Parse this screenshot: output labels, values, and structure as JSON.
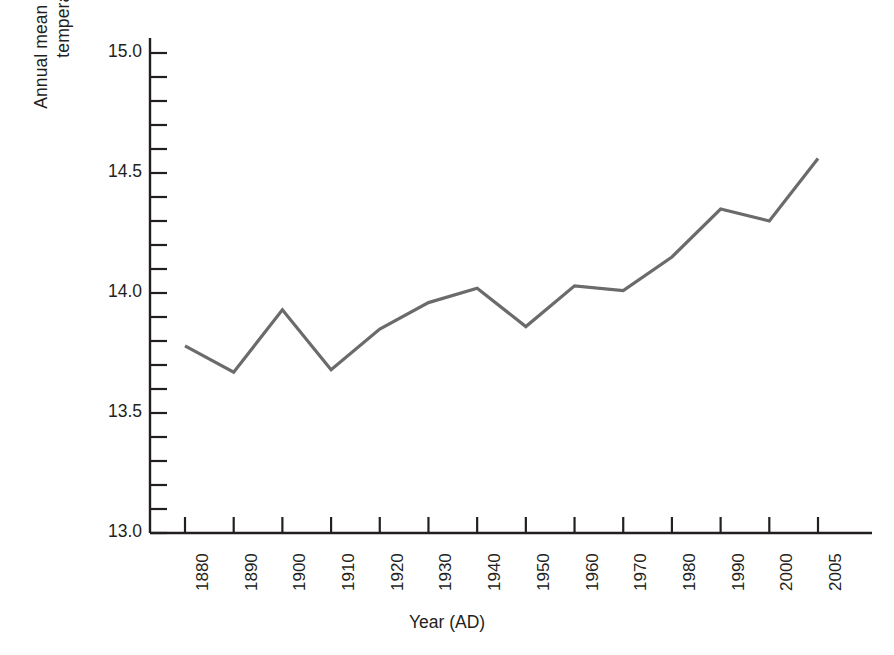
{
  "figure": {
    "background_color": "#ffffff",
    "axis_color": "#231f20",
    "text_color": "#231f20"
  },
  "axis_titles": {
    "x": "Year (AD)",
    "y_line1": "Annual mean global surface",
    "y_line2_prefix": "temperature ",
    "y_line2_degree": "◦",
    "y_line2_suffix": "C",
    "y_full": "Annual mean global surface temperature °C"
  },
  "chart_data": {
    "type": "line",
    "title": "",
    "subtitle": "",
    "xlabel": "Year (AD)",
    "ylabel": "Annual mean global surface temperature °C",
    "xlim": [
      1880,
      2005
    ],
    "ylim": [
      13.0,
      15.0
    ],
    "grid": false,
    "legend": false,
    "legend_position": "none",
    "line_color": "#6b6b6b",
    "line_width": 3.2,
    "x_tick_labels": [
      "1880",
      "1890",
      "1900",
      "1910",
      "1920",
      "1930",
      "1940",
      "1950",
      "1960",
      "1970",
      "1980",
      "1990",
      "2000",
      "2005"
    ],
    "x_tick_values": [
      1880,
      1890,
      1900,
      1910,
      1920,
      1930,
      1940,
      1950,
      1960,
      1970,
      1980,
      1990,
      2000,
      2005
    ],
    "x_tick_rotation": 90,
    "x_axis_scale": "categorical-even-spacing",
    "y_major_ticks": [
      13.0,
      13.5,
      14.0,
      14.5,
      15.0
    ],
    "y_major_tick_labels": [
      "13.0",
      "13.5",
      "14.0",
      "14.5",
      "15.0"
    ],
    "y_minor_tick_interval": 0.1,
    "y_minor_ticks": [
      13.1,
      13.2,
      13.3,
      13.4,
      13.6,
      13.7,
      13.8,
      13.9,
      14.1,
      14.2,
      14.3,
      14.4,
      14.6,
      14.7,
      14.8,
      14.9
    ],
    "series": [
      {
        "name": "Annual mean global surface temperature",
        "x": [
          1880,
          1890,
          1900,
          1910,
          1920,
          1930,
          1940,
          1950,
          1960,
          1970,
          1980,
          1990,
          2000,
          2005
        ],
        "values": [
          13.78,
          13.67,
          13.93,
          13.68,
          13.85,
          13.96,
          14.02,
          13.86,
          14.03,
          14.01,
          14.15,
          14.35,
          14.3,
          14.56
        ]
      }
    ],
    "annotations": []
  }
}
